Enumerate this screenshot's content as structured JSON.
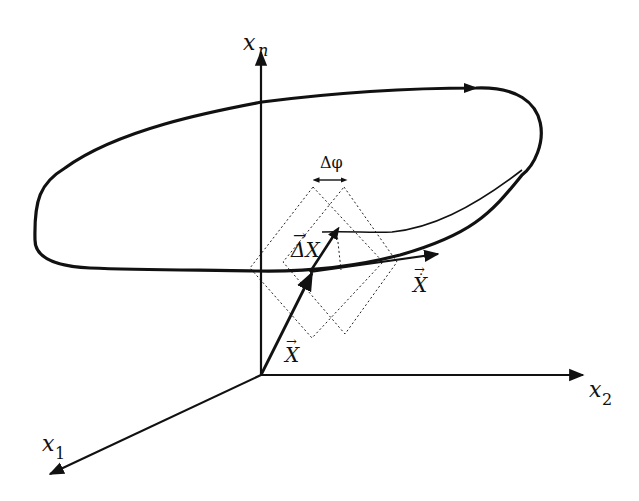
{
  "figure": {
    "type": "phase-space diagram",
    "colors": {
      "ink": "#111111",
      "background": "#ffffff"
    },
    "axes": [
      {
        "id": "x1",
        "label": "x",
        "subscript": "1",
        "direction": "toward viewer (lower-left)"
      },
      {
        "id": "x2",
        "label": "x",
        "subscript": "2",
        "direction": "right"
      },
      {
        "id": "xn",
        "label": "x",
        "subscript": "n",
        "direction": "up"
      }
    ],
    "labels": {
      "state_vector": {
        "arrow": "→",
        "text": "X"
      },
      "velocity_vector": {
        "arrow": "→",
        "dot": "·",
        "text": "X"
      },
      "perturbation_vector": {
        "arrow": "→",
        "text": "ΔX"
      },
      "phase_shift": {
        "text": "Δφ"
      }
    },
    "elements": {
      "limit_cycle": "closed orbit (thick solid curve) with direction arrowhead",
      "perturbed_trajectory": "thin curve returning to the cycle",
      "isochron_sets": "two dotted diamond outlines offset by Δφ"
    }
  }
}
